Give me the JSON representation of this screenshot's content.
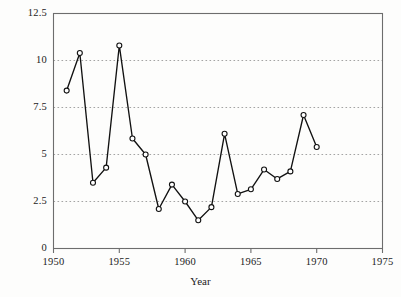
{
  "chart_data": {
    "type": "line",
    "title": "",
    "xlabel": "Year",
    "ylabel": "χ² goodness-of-fit statistic",
    "ylabel_base": "goodness-of-fit statistic",
    "ylabel_symbol": "χ",
    "ylabel_exponent": "2",
    "xlim": [
      1950,
      1975
    ],
    "ylim": [
      0,
      12.5
    ],
    "xticks": [
      1950,
      1955,
      1960,
      1965,
      1970,
      1975
    ],
    "xtick_labels": [
      "1950",
      "1955",
      "1960",
      "1965",
      "1970",
      "1975"
    ],
    "yticks": [
      0,
      2.5,
      5,
      7.5,
      10,
      12.5
    ],
    "ytick_labels": [
      "0",
      "2.5",
      "5",
      "7.5",
      "10",
      "12.5"
    ],
    "grid": "horizontal-dotted",
    "legend": "none",
    "marker": "open-circle",
    "line_color": "#111111",
    "marker_face_color": "#ffffff",
    "grid_color": "#9a9a9a",
    "axis_color": "#6d6d6d",
    "background_color": "#fdfdfc",
    "x": [
      1951,
      1952,
      1953,
      1954,
      1955,
      1956,
      1957,
      1958,
      1959,
      1960,
      1961,
      1962,
      1963,
      1964,
      1965,
      1966,
      1967,
      1968,
      1969,
      1970
    ],
    "values": [
      8.4,
      10.4,
      3.5,
      4.3,
      10.8,
      5.85,
      5.0,
      2.1,
      3.4,
      2.5,
      1.5,
      2.2,
      6.1,
      2.9,
      3.15,
      4.2,
      3.7,
      4.1,
      7.1,
      5.4
    ],
    "series": [
      {
        "name": "chi-square goodness-of-fit statistic",
        "values": [
          8.4,
          10.4,
          3.5,
          4.3,
          10.8,
          5.85,
          5.0,
          2.1,
          3.4,
          2.5,
          1.5,
          2.2,
          6.1,
          2.9,
          3.15,
          4.2,
          3.7,
          4.1,
          7.1,
          5.4
        ]
      }
    ]
  }
}
